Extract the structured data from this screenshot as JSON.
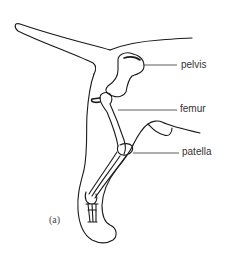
{
  "diagram": {
    "figure_label": "(a)",
    "labels": [
      {
        "text": "pelvis",
        "x": 181,
        "y": 60
      },
      {
        "text": "femur",
        "x": 180,
        "y": 104
      },
      {
        "text": "patella",
        "x": 182,
        "y": 146
      }
    ],
    "colors": {
      "stroke": "#1a1a1a",
      "text": "#333333",
      "background": "#ffffff"
    }
  }
}
